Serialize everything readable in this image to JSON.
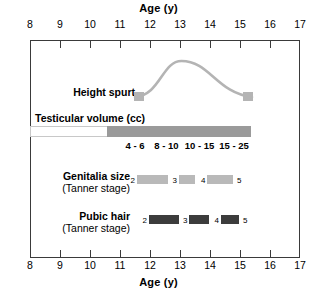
{
  "axis": {
    "title": "Age (y)",
    "unit": "y",
    "min": 8,
    "max": 17,
    "ticks": [
      8,
      9,
      10,
      11,
      12,
      13,
      14,
      15,
      16,
      17
    ],
    "tick_labels": [
      "8",
      "9",
      "10",
      "11",
      "12",
      "13",
      "14",
      "15",
      "16",
      "17"
    ]
  },
  "rows": {
    "height_spurt": {
      "label": "Height spurt",
      "sublabel": "",
      "start_age": 11.5,
      "peak_age": 13.05,
      "end_age": 15.4,
      "color": "#b4b4b4"
    },
    "testicular_volume": {
      "label": "Testicular volume (cc)",
      "bar_start_age": 8.0,
      "bar_end_age": 15.35,
      "fill_start_age": 10.55,
      "fill_color": "#9a9a9a",
      "segments": [
        {
          "value": "4 - 6",
          "center_age": 11.5
        },
        {
          "value": "8 - 10",
          "center_age": 12.55
        },
        {
          "value": "10 - 15",
          "center_age": 13.65
        },
        {
          "value": "15 - 25",
          "center_age": 14.8
        }
      ]
    },
    "genitalia": {
      "label": "Genitalia size",
      "sublabel": "(Tanner stage)",
      "color": "#b9b9b9",
      "stages": [
        {
          "stage": "2",
          "start_age": 11.55,
          "end_age": 12.6
        },
        {
          "stage": "3",
          "start_age": 12.95,
          "end_age": 13.5
        },
        {
          "stage": "4",
          "start_age": 13.9,
          "end_age": 14.75
        },
        {
          "stage": "5",
          "start_age": 15.1,
          "end_age": 15.1
        }
      ],
      "stage_marks": [
        "2",
        "3",
        "4",
        "5"
      ]
    },
    "pubic_hair": {
      "label": "Pubic hair",
      "sublabel": "(Tanner stage)",
      "color": "#3c3c3c",
      "stages": [
        {
          "stage": "2",
          "start_age": 11.95,
          "end_age": 12.95
        },
        {
          "stage": "3",
          "start_age": 13.3,
          "end_age": 13.95
        },
        {
          "stage": "4",
          "start_age": 14.35,
          "end_age": 14.95
        },
        {
          "stage": "5",
          "start_age": 15.3,
          "end_age": 15.3
        }
      ],
      "stage_marks": [
        "2",
        "3",
        "4",
        "5"
      ]
    }
  },
  "chart_data": {
    "type": "timeline",
    "title": "",
    "xlabel": "Age (y)",
    "ylabel": "",
    "xlim": [
      8,
      17
    ],
    "grid": false,
    "legend": "none",
    "series": [
      {
        "name": "Height spurt",
        "kind": "curve",
        "x_start": 11.5,
        "x_peak": 13.05,
        "x_end": 15.4,
        "color": "#b4b4b4"
      },
      {
        "name": "Testicular volume (cc)",
        "kind": "bar",
        "x_start": 10.55,
        "x_end": 15.35,
        "color": "#9a9a9a",
        "annotations": [
          {
            "label": "4 - 6",
            "x": 11.5
          },
          {
            "label": "8 - 10",
            "x": 12.55
          },
          {
            "label": "10 - 15",
            "x": 13.65
          },
          {
            "label": "15 - 25",
            "x": 14.8
          }
        ]
      },
      {
        "name": "Genitalia size (Tanner stage)",
        "kind": "stage-blocks",
        "color": "#b9b9b9",
        "blocks": [
          {
            "stage": "2",
            "x_start": 11.55,
            "x_end": 12.6
          },
          {
            "stage": "3",
            "x_start": 12.95,
            "x_end": 13.5
          },
          {
            "stage": "4",
            "x_start": 13.9,
            "x_end": 14.75
          }
        ],
        "end_mark": "5"
      },
      {
        "name": "Pubic hair (Tanner stage)",
        "kind": "stage-blocks",
        "color": "#3c3c3c",
        "blocks": [
          {
            "stage": "2",
            "x_start": 11.95,
            "x_end": 12.95
          },
          {
            "stage": "3",
            "x_start": 13.3,
            "x_end": 13.95
          },
          {
            "stage": "4",
            "x_start": 14.35,
            "x_end": 14.95
          }
        ],
        "end_mark": "5"
      }
    ]
  }
}
